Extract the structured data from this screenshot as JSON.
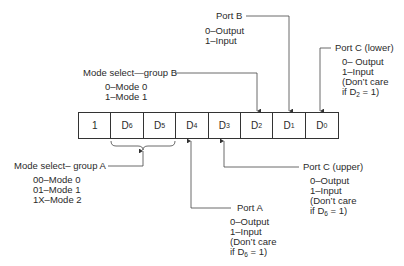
{
  "register": {
    "cells": [
      {
        "main": "1",
        "sub": ""
      },
      {
        "main": "D",
        "sub": "6"
      },
      {
        "main": "D",
        "sub": "5"
      },
      {
        "main": "D",
        "sub": "4"
      },
      {
        "main": "D",
        "sub": "3"
      },
      {
        "main": "D",
        "sub": "2"
      },
      {
        "main": "D",
        "sub": "1"
      },
      {
        "main": "D",
        "sub": "0"
      }
    ]
  },
  "labels": {
    "port_b": {
      "title": "Port B",
      "lines": [
        "0–Output",
        "1–Input"
      ]
    },
    "port_c_lower": {
      "title": "Port C (lower)",
      "lines": [
        "0– Output",
        "1–Input",
        "(Don’t care"
      ],
      "cond_pre": "if D",
      "cond_sub": "2",
      "cond_post": " = 1)"
    },
    "mode_b": {
      "title": "Mode select—group B",
      "lines": [
        "0–Mode 0",
        "1–Mode 1"
      ]
    },
    "mode_a": {
      "title": "Mode select– group A",
      "lines": [
        "00–Mode 0",
        "01–Mode 1",
        "1X–Mode 2"
      ]
    },
    "port_c_upper": {
      "title": "Port C (upper)",
      "lines": [
        "0–Output",
        "1–Input",
        "(Don’t care"
      ],
      "cond_pre": "if D",
      "cond_sub": "6",
      "cond_post": " = 1)"
    },
    "port_a": {
      "title": "Port A",
      "lines": [
        "0–Output",
        "1–Input",
        "(Don’t care"
      ],
      "cond_pre": "if D",
      "cond_sub": "6",
      "cond_post": " = 1)"
    }
  }
}
